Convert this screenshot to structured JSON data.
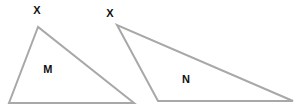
{
  "canvas": {
    "width": 297,
    "height": 109,
    "background_color": "#ffffff"
  },
  "style": {
    "stroke_color": "#a8a8a8",
    "stroke_width": 2,
    "label_color": "#111111",
    "label_font_size": 11
  },
  "shapes": [
    {
      "name": "triangle-m",
      "interior_label": "M",
      "vertex_label": "X",
      "points": "38,27 9,103 134,103",
      "vertices": [
        {
          "name": "apex",
          "x": 38,
          "y": 27
        },
        {
          "name": "bottom-left",
          "x": 9,
          "y": 103
        },
        {
          "name": "bottom-right",
          "x": 134,
          "y": 103
        }
      ],
      "interior_label_pos": {
        "x": 48,
        "y": 69
      },
      "vertex_label_pos": {
        "x": 37,
        "y": 10
      }
    },
    {
      "name": "triangle-n",
      "interior_label": "N",
      "vertex_label": "X",
      "points": "117,25 158,101 293,101",
      "vertices": [
        {
          "name": "apex",
          "x": 117,
          "y": 25
        },
        {
          "name": "bottom-left",
          "x": 158,
          "y": 101
        },
        {
          "name": "bottom-right",
          "x": 293,
          "y": 101
        }
      ],
      "interior_label_pos": {
        "x": 186,
        "y": 79
      },
      "vertex_label_pos": {
        "x": 110,
        "y": 13
      }
    }
  ]
}
